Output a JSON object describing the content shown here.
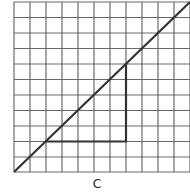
{
  "figure": {
    "label": "C",
    "grid": {
      "columns": 11,
      "rows": 11,
      "line_color": "#555555"
    },
    "diagonal_line": {
      "from": [
        0,
        0
      ],
      "to": [
        11,
        11
      ],
      "color": "#333333"
    },
    "triangle": {
      "vertices": [
        [
          2,
          2
        ],
        [
          7,
          2
        ],
        [
          7,
          7
        ]
      ],
      "color": "#333333"
    }
  }
}
